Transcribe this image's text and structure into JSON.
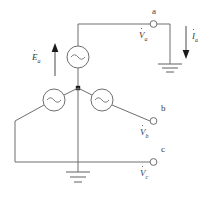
{
  "diagram": {
    "stroke_color": "#6e6e6e",
    "label_color": "#3a3a3a",
    "background": "#ffffff"
  },
  "terminals": [
    {
      "id": "a",
      "label": "a",
      "phasor_base": "V",
      "phasor_sub": "a"
    },
    {
      "id": "b",
      "label": "b",
      "phasor_base": "V",
      "phasor_sub": "b"
    },
    {
      "id": "c",
      "label": "c",
      "phasor_base": "V",
      "phasor_sub": "c"
    }
  ],
  "sources": [
    {
      "id": "ea",
      "name": "source-a",
      "symbol": "ac-source-icon",
      "emf_base": "E",
      "emf_sub": "a"
    },
    {
      "id": "eb",
      "name": "source-b",
      "symbol": "ac-source-icon"
    },
    {
      "id": "ec",
      "name": "source-c",
      "symbol": "ac-source-icon"
    }
  ],
  "labels": {
    "terminal_a": "a",
    "terminal_b": "b",
    "terminal_c": "c",
    "phasor_va_base": "V",
    "phasor_va_sub": "a",
    "phasor_vb_base": "V",
    "phasor_vb_sub": "b",
    "phasor_vc_base": "V",
    "phasor_vc_sub": "c",
    "emf_ea_base": "E",
    "emf_ea_sub": "a",
    "current_ia_base": "I",
    "current_ia_sub": "a"
  },
  "arrows": [
    {
      "id": "ea-arrow",
      "name": "emf-direction-arrow",
      "direction": "up"
    },
    {
      "id": "ia-arrow",
      "name": "current-direction-arrow",
      "direction": "down"
    }
  ],
  "grounds": [
    {
      "id": "gnd-right",
      "name": "ground-symbol-right",
      "bars": 3
    },
    {
      "id": "gnd-neutral",
      "name": "ground-symbol-neutral",
      "bars": 3
    }
  ]
}
